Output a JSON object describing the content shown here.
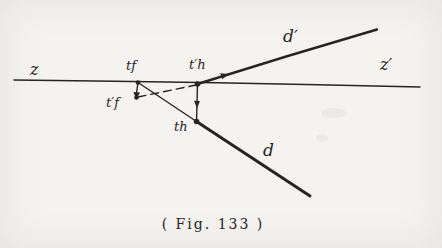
{
  "figure": {
    "caption": "( Fig. 133 )",
    "labels": {
      "axis_left": "z",
      "axis_right": "z′",
      "line_d": "d",
      "line_d_prime": "d′",
      "trace_tf": "tf",
      "trace_tf_prime": "t′f",
      "trace_th_prime": "t′h",
      "trace_th": "th"
    },
    "colors": {
      "ink": "#252525",
      "paper": "#f4f3f0"
    }
  }
}
